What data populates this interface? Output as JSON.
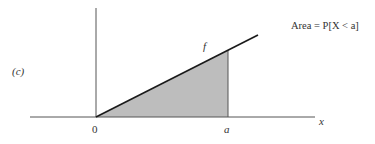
{
  "figure": {
    "panel_label": "(c)",
    "area_label": "Area = P[X < a]",
    "curve_label": "f",
    "x_axis_label": "x",
    "tick_labels": {
      "origin": "0",
      "a": "a"
    },
    "colors": {
      "line": "#1a1a1a",
      "axis": "#555555",
      "shade": "#bdbdbd",
      "text": "#333333"
    }
  }
}
